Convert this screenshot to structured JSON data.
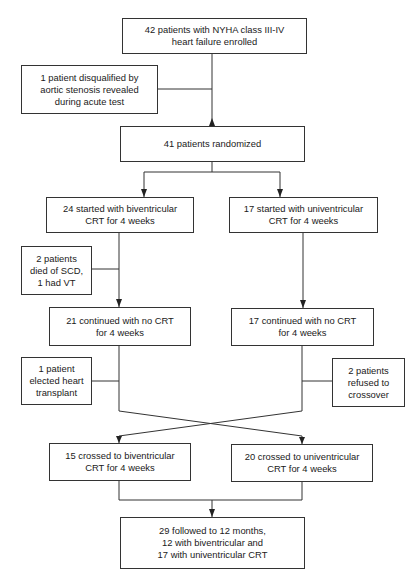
{
  "diagram": {
    "type": "flowchart",
    "nodes": {
      "enrolled": "42 patients with NYHA class III-IV\nheart failure enrolled",
      "disqualified": "1 patient disqualified by\naortic stenosis revealed\nduring acute test",
      "randomized": "41 patients randomized",
      "biv_start": "24 started with biventricular\nCRT for 4 weeks",
      "uni_start": "17 started with univentricular\nCRT for 4 weeks",
      "died": "2 patients\ndied of SCD,\n1 had VT",
      "biv_no_crt": "21 continued with no CRT\nfor 4 weeks",
      "uni_no_crt": "17 continued with no CRT\nfor 4 weeks",
      "transplant": "1 patient\nelected heart\ntransplant",
      "refused": "2 patients\nrefused to\ncrossover",
      "crossed_biv": "15 crossed to biventricular\nCRT for 4 weeks",
      "crossed_uni": "20 crossed to univentricular\nCRT for 4 weeks",
      "followed": "29 followed to 12 months,\n12 with biventricular and\n17 with univentricular CRT"
    },
    "colors": {
      "line": "#333333",
      "background": "#ffffff",
      "text": "#1a1a1a"
    }
  }
}
